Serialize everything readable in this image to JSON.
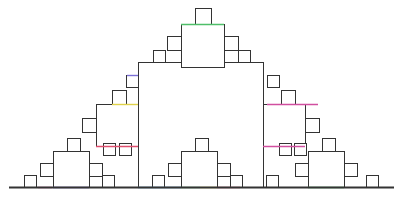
{
  "figure": {
    "title": "Square fractal (Pythagoras-style stepped outline)",
    "background": "#ffffff",
    "stroke_color": "#333333",
    "stroke_width": 1,
    "baseline": {
      "x1": 9,
      "x2": 394,
      "y": 187,
      "width": 2
    },
    "tint_colors": [
      "#7b6fd6",
      "#d14fa0",
      "#4fbf6a",
      "#e0d24a",
      "#e04f6f",
      "#4f9fd6"
    ]
  },
  "squares": [
    {
      "level": 0,
      "x": 138,
      "y": 62,
      "s": 125
    },
    {
      "level": 1,
      "x": 181,
      "y": 24,
      "s": 43
    },
    {
      "level": 1,
      "x": 96,
      "y": 104,
      "s": 42
    },
    {
      "level": 1,
      "x": 263,
      "y": 104,
      "s": 42
    },
    {
      "level": 1,
      "x": 53,
      "y": 151,
      "s": 36
    },
    {
      "level": 1,
      "x": 181,
      "y": 151,
      "s": 36
    },
    {
      "level": 1,
      "x": 308,
      "y": 151,
      "s": 36
    },
    {
      "level": 2,
      "x": 195,
      "y": 8,
      "s": 16
    },
    {
      "level": 2,
      "x": 167,
      "y": 36,
      "s": 14
    },
    {
      "level": 2,
      "x": 224,
      "y": 36,
      "s": 14
    },
    {
      "level": 2,
      "x": 153,
      "y": 50,
      "s": 12
    },
    {
      "level": 2,
      "x": 238,
      "y": 50,
      "s": 12
    },
    {
      "level": 2,
      "x": 126,
      "y": 75,
      "s": 12
    },
    {
      "level": 2,
      "x": 112,
      "y": 90,
      "s": 14
    },
    {
      "level": 2,
      "x": 82,
      "y": 118,
      "s": 14
    },
    {
      "level": 2,
      "x": 119,
      "y": 143,
      "s": 12
    },
    {
      "level": 2,
      "x": 103,
      "y": 143,
      "s": 12
    },
    {
      "level": 2,
      "x": 267,
      "y": 75,
      "s": 12
    },
    {
      "level": 2,
      "x": 281,
      "y": 90,
      "s": 14
    },
    {
      "level": 2,
      "x": 305,
      "y": 118,
      "s": 14
    },
    {
      "level": 2,
      "x": 279,
      "y": 143,
      "s": 12
    },
    {
      "level": 2,
      "x": 294,
      "y": 143,
      "s": 12
    },
    {
      "level": 2,
      "x": 67,
      "y": 138,
      "s": 13
    },
    {
      "level": 2,
      "x": 40,
      "y": 163,
      "s": 13
    },
    {
      "level": 2,
      "x": 89,
      "y": 163,
      "s": 13
    },
    {
      "level": 2,
      "x": 24,
      "y": 175,
      "s": 12
    },
    {
      "level": 2,
      "x": 102,
      "y": 175,
      "s": 12
    },
    {
      "level": 2,
      "x": 195,
      "y": 138,
      "s": 13
    },
    {
      "level": 2,
      "x": 168,
      "y": 163,
      "s": 13
    },
    {
      "level": 2,
      "x": 217,
      "y": 163,
      "s": 13
    },
    {
      "level": 2,
      "x": 152,
      "y": 175,
      "s": 12
    },
    {
      "level": 2,
      "x": 230,
      "y": 175,
      "s": 12
    },
    {
      "level": 2,
      "x": 322,
      "y": 138,
      "s": 13
    },
    {
      "level": 2,
      "x": 295,
      "y": 163,
      "s": 13
    },
    {
      "level": 2,
      "x": 344,
      "y": 163,
      "s": 13
    },
    {
      "level": 2,
      "x": 266,
      "y": 175,
      "s": 12
    },
    {
      "level": 2,
      "x": 366,
      "y": 175,
      "s": 12
    }
  ],
  "tinted_segments": [
    {
      "x1": 181,
      "y1": 24,
      "x2": 224,
      "y2": 24,
      "color": "#4fbf6a"
    },
    {
      "x1": 127,
      "y1": 75,
      "x2": 138,
      "y2": 75,
      "color": "#7b6fd6"
    },
    {
      "x1": 112,
      "y1": 104,
      "x2": 138,
      "y2": 104,
      "color": "#e0d24a"
    },
    {
      "x1": 267,
      "y1": 104,
      "x2": 318,
      "y2": 104,
      "color": "#d14fa0"
    },
    {
      "x1": 96,
      "y1": 146,
      "x2": 138,
      "y2": 146,
      "color": "#e04f6f"
    },
    {
      "x1": 263,
      "y1": 146,
      "x2": 305,
      "y2": 146,
      "color": "#d14fa0"
    },
    {
      "x1": 38,
      "y1": 187,
      "x2": 52,
      "y2": 187,
      "color": "#d14fa0"
    },
    {
      "x1": 53,
      "y1": 187,
      "x2": 89,
      "y2": 187,
      "color": "#7b6fd6"
    },
    {
      "x1": 138,
      "y1": 187,
      "x2": 181,
      "y2": 187,
      "color": "#4f9fd6"
    },
    {
      "x1": 181,
      "y1": 187,
      "x2": 200,
      "y2": 187,
      "color": "#4fbf6a"
    },
    {
      "x1": 200,
      "y1": 187,
      "x2": 217,
      "y2": 187,
      "color": "#e0d24a"
    },
    {
      "x1": 217,
      "y1": 187,
      "x2": 240,
      "y2": 187,
      "color": "#e04f6f"
    },
    {
      "x1": 308,
      "y1": 187,
      "x2": 344,
      "y2": 187,
      "color": "#4fbf6a"
    }
  ]
}
